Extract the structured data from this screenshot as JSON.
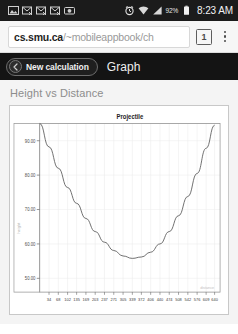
{
  "statusbar": {
    "left_icons": [
      {
        "name": "picture-icon",
        "glyph": "image"
      },
      {
        "name": "mail-sync-icon-1",
        "glyph": "mail"
      },
      {
        "name": "mail-sync-icon-2",
        "glyph": "mail"
      },
      {
        "name": "mail-sync-icon-3",
        "glyph": "mail"
      },
      {
        "name": "camera-icon",
        "glyph": "camera"
      }
    ],
    "alarm_icon": "alarm-icon",
    "wifi_icon": "wifi-icon",
    "signal_icon": "signal-icon",
    "battery_percent": "92%",
    "battery_icon": "battery-icon",
    "clock": "8:23 AM",
    "background": "#1b1b1b"
  },
  "browser": {
    "url_host": "cs.smu.ca",
    "url_path": "/~mobileappbook/ch",
    "url_full": "cs.smu.ca/~mobileappbook/ch",
    "url_placeholder": "Search or type web address",
    "tab_count": "1",
    "menu_icon": "overflow-menu-icon",
    "tab_icon": "tab-counter-icon"
  },
  "appbar": {
    "new_calculation_label": "New calculation",
    "new_calculation_icon": "back-arrow-icon",
    "graph_tab_label": "Graph",
    "background": "#141414"
  },
  "main": {
    "section_title": "Height vs Distance"
  },
  "chart_data": {
    "type": "line",
    "title": "Projectile",
    "xlabel": "distance",
    "ylabel": "height",
    "grid": true,
    "legend": "none",
    "x_tick_labels": [
      "34",
      "68",
      "102",
      "135",
      "169",
      "203",
      "237",
      "271",
      "305",
      "339",
      "372",
      "406",
      "440",
      "474",
      "508",
      "542",
      "576",
      "609",
      "640"
    ],
    "y_tick_labels": [
      "50.00",
      "60.00",
      "70.00",
      "80.00",
      "90.00"
    ],
    "y_tick_values": [
      50,
      60,
      70,
      80,
      90
    ],
    "y_axis_inverted": true,
    "ylim": [
      95,
      46
    ],
    "xlim": [
      0,
      660
    ],
    "line_color": "#555555",
    "x": [
      0,
      34,
      68,
      102,
      135,
      169,
      203,
      237,
      271,
      305,
      339,
      372,
      406,
      440,
      474,
      508,
      542,
      576,
      609,
      640
    ],
    "y": [
      95.0,
      88.2,
      82.0,
      76.4,
      71.8,
      67.4,
      63.6,
      60.5,
      58.1,
      56.5,
      55.8,
      56.2,
      57.6,
      60.0,
      63.6,
      68.2,
      73.8,
      80.5,
      87.8,
      94.5
    ]
  }
}
